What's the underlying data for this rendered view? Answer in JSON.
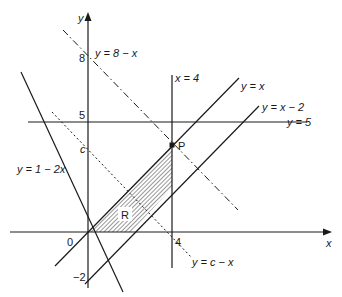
{
  "diagram": {
    "type": "linear-programming-region",
    "axes": {
      "x_label": "x",
      "y_label": "y",
      "origin_label": "0",
      "ticks": {
        "y_8": "8",
        "y_5": "5",
        "y_c": "c",
        "y_neg2": "−2",
        "x_4": "4"
      }
    },
    "lines": [
      {
        "id": "y_8_minus_x",
        "label": "y = 8 − x",
        "style": "dash-dot"
      },
      {
        "id": "x_4",
        "label": "x = 4",
        "style": "solid"
      },
      {
        "id": "y_x",
        "label": "y = x",
        "style": "solid"
      },
      {
        "id": "y_x_minus_2",
        "label": "y = x − 2",
        "style": "solid"
      },
      {
        "id": "y_5",
        "label": "y = 5",
        "style": "solid"
      },
      {
        "id": "y_1_minus_2x",
        "label": "y = 1 − 2x",
        "style": "solid"
      },
      {
        "id": "y_c_minus_x",
        "label": "y = c − x",
        "style": "dotted"
      }
    ],
    "points": [
      {
        "id": "P",
        "label": "P",
        "x": 4,
        "y": 4
      }
    ],
    "region": {
      "label": "R",
      "vertices": [
        [
          0,
          0
        ],
        [
          4,
          4
        ],
        [
          4,
          2
        ],
        [
          2,
          0
        ]
      ],
      "fill": "hatched"
    },
    "colors": {
      "ink": "#1a1a1a",
      "background": "#ffffff"
    }
  }
}
